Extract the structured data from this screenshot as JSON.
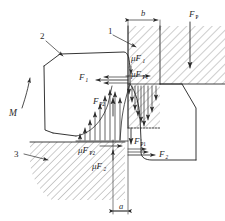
{
  "figure": {
    "type": "engineering-free-body-diagram",
    "stroke_color": "#2b2b2b",
    "hatch_color": "#6f6f6f",
    "background": "#ffffff"
  },
  "part_numbers": [
    {
      "id": "1",
      "label": "1",
      "points_to": "upper-punch-block",
      "x": 113,
      "y": 31
    },
    {
      "id": "2",
      "label": "2",
      "points_to": "upper-workpiece",
      "x": 44,
      "y": 36
    },
    {
      "id": "3",
      "label": "3",
      "points_to": "lower-die-block",
      "x": 18,
      "y": 153
    }
  ],
  "dimensions": [
    {
      "name": "b",
      "label": "b",
      "position": "top",
      "x": 143,
      "y": 15
    },
    {
      "name": "a",
      "label": "a",
      "position": "bottom",
      "x": 122,
      "y": 212
    }
  ],
  "forces": [
    {
      "name": "F_P",
      "label": "F",
      "sub": "P",
      "direction": "down",
      "x": 192,
      "y": 16
    },
    {
      "name": "F_1",
      "label": "F",
      "sub": "1",
      "direction": "left",
      "x": 83,
      "y": 79
    },
    {
      "name": "F_2",
      "label": "F",
      "sub": "2",
      "direction": "right",
      "x": 163,
      "y": 155
    },
    {
      "name": "F_P1",
      "label": "F",
      "sub": "P1",
      "direction": "down",
      "x": 139,
      "y": 141
    },
    {
      "name": "F_P2",
      "label": "F",
      "sub": "P2",
      "direction": "up",
      "x": 97,
      "y": 103
    },
    {
      "name": "muF_1",
      "label": "μF",
      "sub": "1",
      "direction": "down",
      "x": 133,
      "y": 58
    },
    {
      "name": "muF_2",
      "label": "μF",
      "sub": "2",
      "direction": "up",
      "x": 97,
      "y": 165
    },
    {
      "name": "muF_P1",
      "label": "μF",
      "sub": "P1",
      "direction": "right",
      "x": 136,
      "y": 77
    },
    {
      "name": "muF_P2",
      "label": "μF",
      "sub": "P2",
      "direction": "right",
      "x": 86,
      "y": 150
    },
    {
      "name": "M",
      "label": "M",
      "sub": "",
      "direction": "moment",
      "x": 13,
      "y": 91
    }
  ],
  "distributions": [
    {
      "name": "upper-pressure-distribution",
      "direction": "down",
      "arrow_count": 9,
      "region": "right-of-shear-plane"
    },
    {
      "name": "lower-pressure-distribution",
      "direction": "up",
      "arrow_count": 9,
      "region": "left-of-shear-plane"
    }
  ],
  "hatched_regions": [
    {
      "name": "upper-punch-block",
      "part": "1"
    },
    {
      "name": "upper-right-die",
      "part": "1"
    },
    {
      "name": "lower-die-block",
      "part": "3"
    }
  ],
  "bodies": [
    {
      "name": "upper-workpiece",
      "part": "2"
    },
    {
      "name": "lower-workpiece",
      "part": ""
    }
  ]
}
